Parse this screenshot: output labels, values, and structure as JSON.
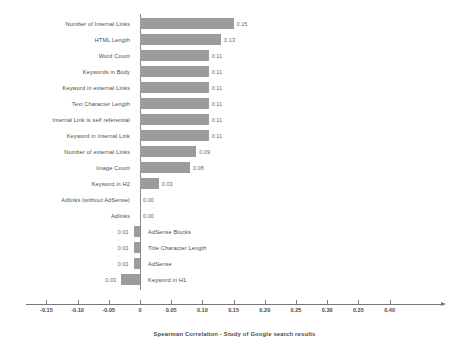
{
  "chart_data": {
    "type": "bar",
    "orientation": "horizontal",
    "title": "",
    "subtitle": "",
    "xlabel": "Spearman Correlation  -  Study of Google search results",
    "ylabel": "",
    "xlim": [
      -0.175,
      0.425
    ],
    "xticks": [
      -0.15,
      -0.1,
      -0.05,
      0,
      0.05,
      0.1,
      0.15,
      0.2,
      0.25,
      0.3,
      0.35,
      0.4
    ],
    "xtick_labels": [
      "-0.15",
      "-0.10",
      "-0.05",
      "0",
      "0.05",
      "0.10",
      "0.15",
      "0.20",
      "0.25",
      "0.30",
      "0.35",
      "0.40"
    ],
    "grid": false,
    "legend": null,
    "bar_color": "#9c9c9c",
    "axis_color": "#777777",
    "categories": [
      "Number of Internal Links",
      "HTML Length",
      "Word Count",
      "Keywords in Body",
      "Keyword in external Links",
      "Text Character Length",
      "Internal Link is self referential",
      "Keyword in Internal Link",
      "Number of external Links",
      "Image Count",
      "Keyword in H2",
      "Adlinks (without AdSense)",
      "Adlinks",
      "AdSense Blocks",
      "Title Character Length",
      "AdSense",
      "Keyword in H1"
    ],
    "values": [
      0.15,
      0.13,
      0.11,
      0.11,
      0.11,
      0.11,
      0.11,
      0.11,
      0.09,
      0.08,
      0.03,
      0.0,
      0.0,
      -0.01,
      -0.01,
      -0.01,
      -0.03
    ],
    "value_labels": [
      "0.15",
      "0.13",
      "0.11",
      "0.11",
      "0.11",
      "0.11",
      "0.11",
      "0.11",
      "0.09",
      "0.08",
      "0.03",
      "0.00",
      "0.00",
      "0.01",
      "0.01",
      "0.01",
      "0.03"
    ]
  },
  "caption": "Spearman Correlation  -  Study of Google search results"
}
